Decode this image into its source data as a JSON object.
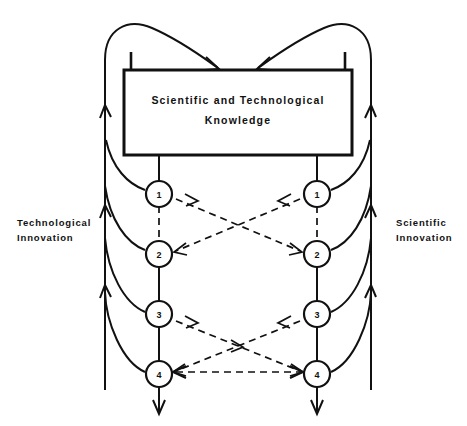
{
  "figure": {
    "title_box": {
      "line1": "Scientific and Technological",
      "line2": "Knowledge"
    },
    "left_label": {
      "line1": "Technological",
      "line2": "Innovation"
    },
    "right_label": {
      "line1": "Scientific",
      "line2": "Innovation"
    },
    "left_nodes": [
      {
        "id": "1",
        "label": "1"
      },
      {
        "id": "2",
        "label": "2"
      },
      {
        "id": "3",
        "label": "3"
      },
      {
        "id": "4",
        "label": "4"
      }
    ],
    "right_nodes": [
      {
        "id": "1",
        "label": "1"
      },
      {
        "id": "2",
        "label": "2"
      },
      {
        "id": "3",
        "label": "3"
      },
      {
        "id": "4",
        "label": "4"
      }
    ],
    "colors": {
      "ink": "#111111",
      "background": "#ffffff"
    }
  }
}
